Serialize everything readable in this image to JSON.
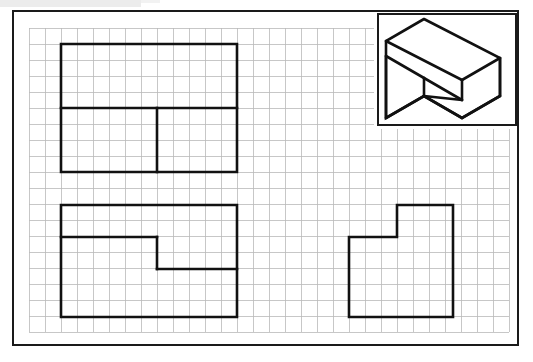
{
  "document": {
    "title": "Orthographic Projection Worksheet",
    "sheet": {
      "width": 533,
      "height": 362,
      "border": {
        "x": 13,
        "y": 11,
        "width": 505,
        "height": 334
      },
      "background_color": "#ffffff",
      "border_color": "#1a1a1a"
    },
    "top_band": {
      "color": "#ececec",
      "x": 0,
      "y": 0,
      "width": 141,
      "height": 7
    }
  },
  "grid": {
    "cell_size": 16,
    "origin_x": 29,
    "origin_y": 28,
    "columns": 30,
    "rows": 19,
    "line_color": "#b9b9b9",
    "line_width": 0.8,
    "notes": "Square graph grid fills the sheet interior; suppressed behind the isometric panel."
  },
  "iso_panel": {
    "label": "isometric-pictorial-panel",
    "x": 378,
    "y": 14,
    "width": 138,
    "height": 111,
    "border_color": "#1a1a1a",
    "fill": "#ffffff"
  },
  "views": [
    {
      "id": "top-view",
      "name": "Top View",
      "position": "upper-left",
      "bounds": {
        "x": 61,
        "y": 44,
        "width": 176,
        "height": 128
      },
      "outline_points": "61,44 237,44 237,172 61,172",
      "internal_lines": [
        {
          "name": "horizontal-divider",
          "points": "61,108 237,108"
        },
        {
          "name": "vertical-step-edge",
          "points": "157,108 157,172"
        }
      ],
      "stroke_color": "#111111",
      "stroke_width": 2.6
    },
    {
      "id": "front-view",
      "name": "Front View",
      "position": "lower-left",
      "bounds": {
        "x": 61,
        "y": 205,
        "width": 176,
        "height": 112
      },
      "outline_points": "61,205 237,205 237,317 61,317",
      "internal_lines": [
        {
          "name": "step-upper-horizontal",
          "points": "61,237 157,237"
        },
        {
          "name": "step-vertical",
          "points": "157,237 157,269"
        },
        {
          "name": "step-lower-horizontal",
          "points": "157,269 237,269"
        }
      ],
      "stroke_color": "#111111",
      "stroke_width": 2.6
    },
    {
      "id": "side-view",
      "name": "Right Side View",
      "position": "lower-right",
      "bounds": {
        "x": 349,
        "y": 205,
        "width": 104,
        "height": 112
      },
      "outline_points": "397,205 453,205 453,317 349,317 349,237 397,237",
      "internal_lines": [],
      "stroke_color": "#111111",
      "stroke_width": 2.6
    }
  ],
  "isometric_drawing": {
    "name": "stepped-block-isometric",
    "description": "Stepped rectangular block shown in isometric projection",
    "stroke_color": "#111111",
    "stroke_width": 2.6,
    "edges": [
      {
        "name": "top-face-outline",
        "points": "424,19 500,58 462,80 386,41 424,19"
      },
      {
        "name": "upper-left-vertical",
        "points": "386,41 386,56"
      },
      {
        "name": "upper-riser-top",
        "points": "386,56 424,78"
      },
      {
        "name": "mid-step-right",
        "points": "424,78 462,56"
      },
      {
        "name": "riser-back-edge",
        "points": "462,56 462,80"
      },
      {
        "name": "left-body-top",
        "points": "386,56 386,56"
      },
      {
        "name": "left-front-vertical",
        "points": "386,41 386,41"
      },
      {
        "name": "left-silhouette",
        "points": "386,41 386,41"
      },
      {
        "name": "body-left-edge",
        "points": "386,56 386,56"
      }
    ],
    "outer_silhouette": "424,19 500,58 500,96 462,118 424,96 386,118 386,56 386,41 424,19",
    "detail_edges": [
      {
        "name": "top-face-front-edge",
        "points": "386,41 462,80"
      },
      {
        "name": "top-face-right-edge",
        "points": "462,80 500,58"
      },
      {
        "name": "step-tread-edge",
        "points": "424,78 462,100"
      },
      {
        "name": "step-riser-left",
        "points": "424,78 424,96"
      },
      {
        "name": "step-tread-left",
        "points": "386,56 424,78"
      },
      {
        "name": "lower-front-edge",
        "points": "424,96 462,118"
      },
      {
        "name": "right-face-vertical",
        "points": "500,58 500,96"
      },
      {
        "name": "right-bottom-edge",
        "points": "462,118 500,96"
      },
      {
        "name": "left-face-vertical",
        "points": "386,56 386,118"
      },
      {
        "name": "left-bottom-edge",
        "points": "386,118 424,96"
      },
      {
        "name": "inner-step-vertical",
        "points": "462,80 462,100"
      },
      {
        "name": "inner-step-front",
        "points": "424,96 462,100"
      }
    ]
  }
}
